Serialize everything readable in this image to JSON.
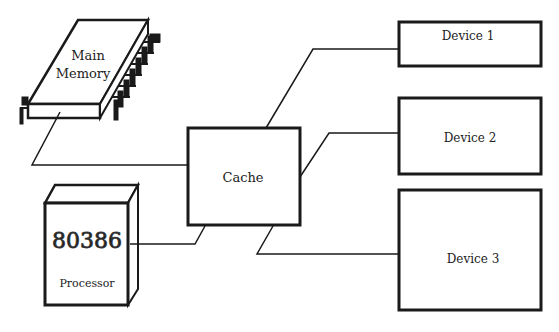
{
  "diagram": {
    "type": "computer-architecture block diagram",
    "nodes": {
      "main_memory": {
        "label_line1": "Main",
        "label_line2": "Memory",
        "shape": "chip"
      },
      "processor": {
        "chip_label": "80386",
        "label": "Processor",
        "shape": "box-3d"
      },
      "cache": {
        "label": "Cache",
        "shape": "rectangle"
      },
      "device1": {
        "label": "Device 1",
        "shape": "rectangle"
      },
      "device2": {
        "label": "Device 2",
        "shape": "rectangle"
      },
      "device3": {
        "label": "Device 3",
        "shape": "rectangle"
      }
    },
    "edges": [
      {
        "from": "Main Memory",
        "to": "Cache"
      },
      {
        "from": "Processor",
        "to": "Cache"
      },
      {
        "from": "Cache",
        "to": "Device 1"
      },
      {
        "from": "Cache",
        "to": "Device 2"
      },
      {
        "from": "Cache",
        "to": "Device 3"
      }
    ],
    "colors": {
      "stroke": "#1a1a1a",
      "background": "#ffffff"
    }
  }
}
